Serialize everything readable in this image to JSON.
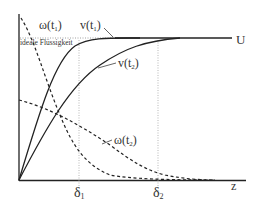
{
  "diagram": {
    "title": "",
    "axes": {
      "x_label": "z",
      "y_label": ""
    },
    "levels": {
      "U_label": "U",
      "ideal_label": "ideale Flüssigkeit"
    },
    "markers": {
      "delta1": "δ",
      "delta1_sub": "1",
      "delta2": "δ",
      "delta2_sub": "2"
    },
    "curves": {
      "v_t1": {
        "name": "v(t",
        "sub": "1",
        "close": ")",
        "style": "solid"
      },
      "v_t2": {
        "name": "v(t",
        "sub": "2",
        "close": ")",
        "style": "solid"
      },
      "omega_t1": {
        "name": "ω(t",
        "sub": "1",
        "close": ")",
        "style": "dashed"
      },
      "omega_t2": {
        "name": "ω(t",
        "sub": "2",
        "close": ")",
        "style": "dashed"
      }
    },
    "colors": {
      "line": "#222222",
      "guide": "#999999"
    }
  }
}
